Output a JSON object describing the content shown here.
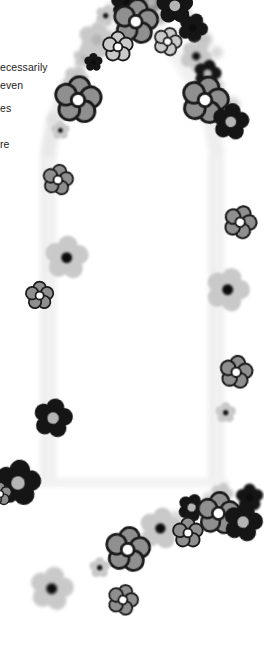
{
  "document": {
    "kind": "scanned-page-fragment",
    "page_background": "#ffffff",
    "width_px": 264,
    "height_px": 645
  },
  "body_text": {
    "description": "Body copy clipped by the left page edge",
    "color": "#1b1b1b",
    "lines": [
      "ecessarily",
      "even",
      "es",
      "re"
    ]
  },
  "artwork": {
    "title": "Floral arch",
    "description": "Pointed arch formed from daisy-like flowers over a pale gray pillar shape, with a diagonal sweep of flowers across the lower area",
    "palette": {
      "petal_dark": "#151515",
      "petal_mid": "#8f8f8f",
      "petal_light": "#c9c9c9",
      "petal_pale": "#dcdcdc",
      "outline": "#1b1b1b",
      "center_white": "#ffffff",
      "center_dark": "#0c0c0c",
      "center_gray": "#b5b5b5",
      "pillar": "#f1f1f1",
      "pillar_edge": "#e4e4e4"
    },
    "arch": {
      "shape": "pointed-gothic",
      "apex_x": 132,
      "apex_y": 8,
      "left_pillar_x": 48,
      "right_pillar_x": 216,
      "base_y": 492,
      "pillar_width": 15,
      "fill": "#f1f1f1"
    },
    "flowers": [
      {
        "id": "f01",
        "x": 127,
        "y": 4,
        "r": 15,
        "tone": "dark",
        "center": "dark",
        "outline": false,
        "rot": 10,
        "blur": 0.6
      },
      {
        "id": "f02",
        "x": 151,
        "y": 2,
        "r": 11,
        "tone": "mid",
        "center": "gray",
        "outline": false,
        "rot": 35,
        "blur": 1.4
      },
      {
        "id": "f03",
        "x": 175,
        "y": 6,
        "r": 16,
        "tone": "dark",
        "center": "gray",
        "outline": false,
        "rot": 0,
        "blur": 0.7
      },
      {
        "id": "f04",
        "x": 106,
        "y": 16,
        "r": 9,
        "tone": "light",
        "center": "dark",
        "outline": false,
        "rot": 20,
        "blur": 1.2
      },
      {
        "id": "f05",
        "x": 136,
        "y": 22,
        "r": 19,
        "tone": "mid",
        "center": "white",
        "outline": true,
        "rot": 8,
        "blur": 0.2
      },
      {
        "id": "f06",
        "x": 193,
        "y": 28,
        "r": 13,
        "tone": "dark",
        "center": "dark",
        "outline": false,
        "rot": 25,
        "blur": 0.6
      },
      {
        "id": "f07",
        "x": 97,
        "y": 40,
        "r": 16,
        "tone": "light",
        "center": "gray",
        "outline": false,
        "rot": 12,
        "blur": 1.6
      },
      {
        "id": "f08",
        "x": 118,
        "y": 47,
        "r": 13,
        "tone": "light",
        "center": "white",
        "outline": true,
        "rot": 0,
        "blur": 0.2
      },
      {
        "id": "f09",
        "x": 168,
        "y": 42,
        "r": 12,
        "tone": "light",
        "center": "white",
        "outline": true,
        "rot": 18,
        "blur": 0.3
      },
      {
        "id": "f10",
        "x": 84,
        "y": 58,
        "r": 9,
        "tone": "light",
        "center": "gray",
        "outline": false,
        "rot": 5,
        "blur": 1.8
      },
      {
        "id": "f11",
        "x": 93,
        "y": 62,
        "r": 8,
        "tone": "dark",
        "center": "dark",
        "outline": false,
        "rot": 0,
        "blur": 0.7
      },
      {
        "id": "f12",
        "x": 196,
        "y": 56,
        "r": 14,
        "tone": "light",
        "center": "dark",
        "outline": false,
        "rot": 30,
        "blur": 1.4
      },
      {
        "id": "f13",
        "x": 76,
        "y": 78,
        "r": 11,
        "tone": "light",
        "center": "gray",
        "outline": false,
        "rot": 22,
        "blur": 1.7
      },
      {
        "id": "f14",
        "x": 208,
        "y": 74,
        "r": 12,
        "tone": "dark",
        "center": "gray",
        "outline": false,
        "rot": 14,
        "blur": 0.8
      },
      {
        "id": "f15",
        "x": 78,
        "y": 100,
        "r": 20,
        "tone": "mid",
        "center": "white",
        "outline": true,
        "rot": 6,
        "blur": 0.2
      },
      {
        "id": "f16",
        "x": 205,
        "y": 100,
        "r": 20,
        "tone": "mid",
        "center": "white",
        "outline": true,
        "rot": 15,
        "blur": 0.2
      },
      {
        "id": "f17",
        "x": 231,
        "y": 122,
        "r": 16,
        "tone": "dark",
        "center": "gray",
        "outline": false,
        "rot": 9,
        "blur": 0.5
      },
      {
        "id": "f18",
        "x": 60,
        "y": 130,
        "r": 8,
        "tone": "light",
        "center": "dark",
        "outline": false,
        "rot": 0,
        "blur": 1.0
      },
      {
        "id": "f19",
        "x": 58,
        "y": 180,
        "r": 13,
        "tone": "mid",
        "center": "white",
        "outline": true,
        "rot": 11,
        "blur": 0.2
      },
      {
        "id": "f20",
        "x": 240,
        "y": 222,
        "r": 14,
        "tone": "mid",
        "center": "white",
        "outline": true,
        "rot": 20,
        "blur": 0.2
      },
      {
        "id": "f21",
        "x": 67,
        "y": 258,
        "r": 19,
        "tone": "light",
        "center": "dark",
        "outline": false,
        "rot": 5,
        "blur": 1.1
      },
      {
        "id": "f22",
        "x": 228,
        "y": 290,
        "r": 19,
        "tone": "light",
        "center": "dark",
        "outline": false,
        "rot": 18,
        "blur": 1.1
      },
      {
        "id": "f23",
        "x": 40,
        "y": 296,
        "r": 12,
        "tone": "mid",
        "center": "white",
        "outline": true,
        "rot": 0,
        "blur": 0.2
      },
      {
        "id": "f24",
        "x": 236,
        "y": 372,
        "r": 14,
        "tone": "mid",
        "center": "white",
        "outline": true,
        "rot": 10,
        "blur": 0.2
      },
      {
        "id": "f25",
        "x": 226,
        "y": 413,
        "r": 9,
        "tone": "light",
        "center": "dark",
        "outline": false,
        "rot": 0,
        "blur": 1.2
      },
      {
        "id": "f26",
        "x": 53,
        "y": 418,
        "r": 17,
        "tone": "dark",
        "center": "gray",
        "outline": false,
        "rot": 12,
        "blur": 0.5
      },
      {
        "id": "f27",
        "x": 18,
        "y": 483,
        "r": 20,
        "tone": "dark",
        "center": "gray",
        "outline": false,
        "rot": 8,
        "blur": 0.5
      },
      {
        "id": "f28",
        "x": 0,
        "y": 494,
        "r": 10,
        "tone": "mid",
        "center": "white",
        "outline": true,
        "rot": 0,
        "blur": 0.3
      },
      {
        "id": "f29",
        "x": 222,
        "y": 494,
        "r": 10,
        "tone": "light",
        "center": "gray",
        "outline": false,
        "rot": 15,
        "blur": 1.4
      },
      {
        "id": "f30",
        "x": 250,
        "y": 498,
        "r": 12,
        "tone": "dark",
        "center": "dark",
        "outline": false,
        "rot": 0,
        "blur": 0.8
      },
      {
        "id": "f31",
        "x": 192,
        "y": 508,
        "r": 12,
        "tone": "dark",
        "center": "gray",
        "outline": false,
        "rot": 22,
        "blur": 0.7
      },
      {
        "id": "f32",
        "x": 218,
        "y": 513,
        "r": 18,
        "tone": "mid",
        "center": "white",
        "outline": true,
        "rot": 6,
        "blur": 0.2
      },
      {
        "id": "f33",
        "x": 243,
        "y": 522,
        "r": 17,
        "tone": "dark",
        "center": "gray",
        "outline": false,
        "rot": 14,
        "blur": 0.6
      },
      {
        "id": "f34",
        "x": 160,
        "y": 528,
        "r": 18,
        "tone": "light",
        "center": "dark",
        "outline": false,
        "rot": 10,
        "blur": 1.3
      },
      {
        "id": "f35",
        "x": 188,
        "y": 533,
        "r": 13,
        "tone": "mid",
        "center": "white",
        "outline": true,
        "rot": 0,
        "blur": 0.3
      },
      {
        "id": "f36",
        "x": 128,
        "y": 550,
        "r": 19,
        "tone": "mid",
        "center": "white",
        "outline": true,
        "rot": 8,
        "blur": 0.2
      },
      {
        "id": "f37",
        "x": 100,
        "y": 568,
        "r": 9,
        "tone": "light",
        "center": "dark",
        "outline": false,
        "rot": 0,
        "blur": 1.3
      },
      {
        "id": "f38",
        "x": 52,
        "y": 589,
        "r": 19,
        "tone": "light",
        "center": "dark",
        "outline": false,
        "rot": 12,
        "blur": 1.4
      },
      {
        "id": "f39",
        "x": 123,
        "y": 600,
        "r": 13,
        "tone": "mid",
        "center": "white",
        "outline": true,
        "rot": 18,
        "blur": 0.3
      }
    ],
    "blobs": [
      {
        "x": 113,
        "y": 10,
        "d": 16,
        "tone": "#d6d6d6"
      },
      {
        "x": 160,
        "y": 18,
        "d": 14,
        "tone": "#bdbdbd"
      },
      {
        "x": 186,
        "y": 14,
        "d": 12,
        "tone": "#cfcfcf"
      },
      {
        "x": 90,
        "y": 52,
        "d": 18,
        "tone": "#d2d2d2"
      },
      {
        "x": 204,
        "y": 40,
        "d": 16,
        "tone": "#c6c6c6"
      },
      {
        "x": 216,
        "y": 52,
        "d": 13,
        "tone": "#dadada"
      },
      {
        "x": 70,
        "y": 88,
        "d": 20,
        "tone": "#cfcfcf"
      },
      {
        "x": 214,
        "y": 86,
        "d": 18,
        "tone": "#c2c2c2"
      },
      {
        "x": 232,
        "y": 104,
        "d": 15,
        "tone": "#d4d4d4"
      },
      {
        "x": 54,
        "y": 120,
        "d": 14,
        "tone": "#dfdfdf"
      },
      {
        "x": 210,
        "y": 500,
        "d": 16,
        "tone": "#d3d3d3"
      },
      {
        "x": 176,
        "y": 520,
        "d": 18,
        "tone": "#d8d8d8"
      },
      {
        "x": 146,
        "y": 540,
        "d": 16,
        "tone": "#dcdcdc"
      }
    ]
  }
}
